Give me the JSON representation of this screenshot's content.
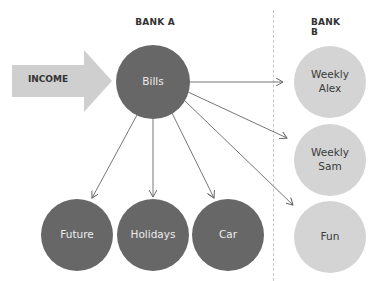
{
  "headers": {
    "bank_a": "BANK A",
    "bank_b": "BANK B"
  },
  "income": {
    "label": "INCOME"
  },
  "source": {
    "label": "Bills"
  },
  "bank_a_targets": [
    {
      "label": "Future"
    },
    {
      "label": "Holidays"
    },
    {
      "label": "Car"
    }
  ],
  "bank_b_targets": [
    {
      "label": "Weekly\nAlex"
    },
    {
      "label": "Weekly\nSam"
    },
    {
      "label": "Fun"
    }
  ],
  "colors": {
    "dark_node": "#676767",
    "light_node": "#d4d4d4",
    "arrow": "#cfcfcf",
    "line": "#666666"
  }
}
